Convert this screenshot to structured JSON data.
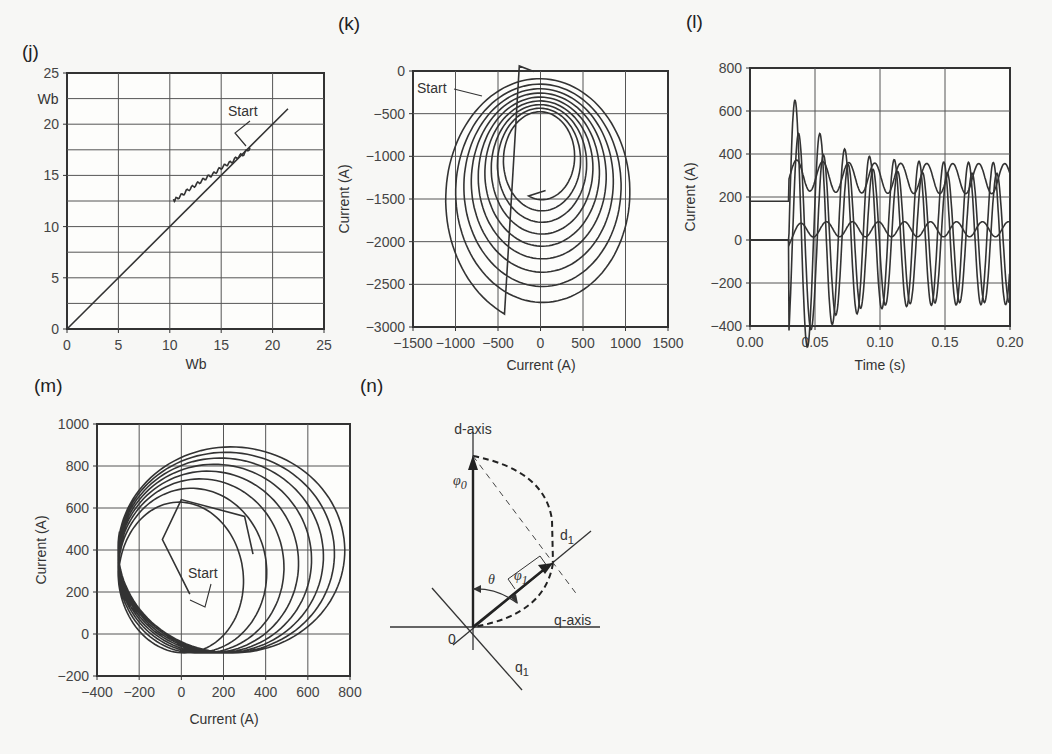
{
  "chart_data": [
    {
      "panel": "(j)",
      "type": "line",
      "title": "",
      "xlabel": "Wb",
      "ylabel": "Wb",
      "xlim": [
        0,
        25
      ],
      "ylim": [
        0,
        25
      ],
      "xticks": [
        "0",
        "5",
        "10",
        "15",
        "20",
        "25"
      ],
      "yticks": [
        "0",
        "5",
        "10",
        "15",
        "20",
        "25"
      ],
      "grid": true,
      "annotations": [
        "Start"
      ],
      "series": [
        {
          "name": "reference line",
          "x": [
            0,
            21.5
          ],
          "y": [
            0,
            21.5
          ]
        },
        {
          "name": "flux trajectory",
          "x": [
            17.8,
            17.2,
            16.6,
            16.0,
            15.4,
            14.8,
            14.2,
            13.6,
            13.0,
            12.4,
            11.8,
            11.2,
            10.6,
            10.3
          ],
          "y": [
            17.7,
            17.1,
            16.8,
            16.3,
            16.0,
            15.6,
            15.1,
            14.8,
            14.4,
            14.0,
            13.6,
            13.1,
            12.7,
            12.5
          ]
        }
      ]
    },
    {
      "panel": "(k)",
      "type": "line",
      "title": "",
      "xlabel": "Current (A)",
      "ylabel": "Current (A)",
      "xlim": [
        -1500,
        1500
      ],
      "ylim": [
        -3000,
        0
      ],
      "xticks": [
        "−1500",
        "−1000",
        "−500",
        "0",
        "500",
        "1000",
        "1500"
      ],
      "yticks": [
        "0",
        "−500",
        "−1000",
        "−1500",
        "−2000",
        "−2500",
        "−3000"
      ],
      "grid": true,
      "annotations": [
        "Start"
      ],
      "spiral": {
        "center_start": [
          0,
          -1500
        ],
        "center_end": [
          0,
          -1000
        ],
        "rx_start": 1150,
        "rx_end": 380,
        "ry_start": 1450,
        "ry_end": 500,
        "turns": 9,
        "end_point": [
          60,
          -1400
        ]
      }
    },
    {
      "panel": "(l)",
      "type": "line",
      "title": "",
      "xlabel": "Time (s)",
      "ylabel": "Current (A)",
      "xlim": [
        0,
        0.2
      ],
      "ylim": [
        -400,
        800
      ],
      "xticks": [
        "0.00",
        "0.05",
        "0.10",
        "0.15",
        "0.20"
      ],
      "yticks": [
        "800",
        "600",
        "400",
        "200",
        "0",
        "−200",
        "−400"
      ],
      "grid": true,
      "event_time": 0.03,
      "series": [
        {
          "name": "upper envelope",
          "pre_value": 180,
          "mean": 280,
          "amplitude": 75,
          "freq_hz": 50
        },
        {
          "name": "phase current a",
          "pre_value": 0,
          "peak_first": 700,
          "peak_late": 340,
          "trough": -300,
          "freq_hz": 50
        },
        {
          "name": "phase current b",
          "pre_value": 0,
          "peak_first": 550,
          "peak_late": 300,
          "trough": -320,
          "freq_hz": 50
        },
        {
          "name": "lower trace",
          "pre_value": 0,
          "mean": 50,
          "amplitude": 35,
          "freq_hz": 50
        }
      ]
    },
    {
      "panel": "(m)",
      "type": "line",
      "title": "",
      "xlabel": "Current (A)",
      "ylabel": "Current (A)",
      "xlim": [
        -400,
        800
      ],
      "ylim": [
        -200,
        1000
      ],
      "xticks": [
        "−400",
        "−200",
        "0",
        "200",
        "400",
        "600",
        "800"
      ],
      "yticks": [
        "1000",
        "800",
        "600",
        "400",
        "200",
        "0",
        "−200"
      ],
      "grid": true,
      "annotations": [
        "Start"
      ],
      "spiral": {
        "start_point": [
          40,
          200
        ],
        "outer_center": [
          250,
          410
        ],
        "outer_rx": 550,
        "outer_ry": 500,
        "inner_center": [
          140,
          250
        ],
        "inner_rx": 240,
        "inner_ry": 340,
        "turns": 8,
        "end_point": [
          340,
          380
        ]
      }
    },
    {
      "panel": "(n)",
      "type": "diagram",
      "labels": [
        "d-axis",
        "q-axis",
        "d₁",
        "q₁",
        "φ₀",
        "φ₁",
        "θ",
        "0"
      ]
    }
  ],
  "labels": {
    "panel_j": "(j)",
    "panel_k": "(k)",
    "panel_l": "(l)",
    "panel_m": "(m)",
    "panel_n": "(n)",
    "j_xlabel": "Wb",
    "j_ylabel": "Wb",
    "k_xlabel": "Current (A)",
    "k_ylabel": "Current (A)",
    "l_xlabel": "Time (s)",
    "l_ylabel": "Current (A)",
    "m_xlabel": "Current (A)",
    "m_ylabel": "Current (A)",
    "start": "Start",
    "n_daxis": "d-axis",
    "n_qaxis": "q-axis",
    "n_d1": "d",
    "n_d1_sub": "1",
    "n_q1": "q",
    "n_q1_sub": "1",
    "n_phi0": "φ",
    "n_phi0_sub": "0",
    "n_phi1": "φ",
    "n_phi1_sub": "1",
    "n_theta": "θ",
    "n_origin": "0"
  }
}
